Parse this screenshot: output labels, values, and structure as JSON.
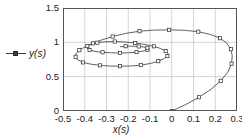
{
  "legend": {
    "marker": "filled-square-line-marker",
    "label": "y(s)"
  },
  "axes": {
    "xlabel": "x(s)",
    "ylabel": "",
    "xticks": [
      "-0.5",
      "-0.4",
      "-0.3",
      "-0.2",
      "-0.1",
      "0",
      "0.1",
      "0.2",
      "0.3"
    ],
    "yticks": [
      "0",
      "0.5",
      "1",
      "1.5"
    ]
  },
  "colors": {
    "line": "#3a3a3a",
    "marker_face": "#ffffff",
    "marker_edge": "#2a2a2a",
    "grid": "#b9b9b9",
    "frame": "#555555",
    "text": "#1a1a1a"
  },
  "chart_data": {
    "type": "line",
    "title": "",
    "xlabel": "x(s)",
    "ylabel": "y(s)",
    "xlim": [
      -0.5,
      0.3
    ],
    "ylim": [
      0,
      1.5
    ],
    "grid": true,
    "legend_position": "left-outside",
    "series": [
      {
        "name": "y(s)",
        "marker": "square",
        "points": [
          [
            0.0,
            0.0
          ],
          [
            0.065,
            0.095
          ],
          [
            0.125,
            0.2
          ],
          [
            0.18,
            0.315
          ],
          [
            0.225,
            0.44
          ],
          [
            0.258,
            0.565
          ],
          [
            0.275,
            0.69
          ],
          [
            0.278,
            0.8
          ],
          [
            0.272,
            0.9
          ],
          [
            0.252,
            0.99
          ],
          [
            0.222,
            1.06
          ],
          [
            0.178,
            1.115
          ],
          [
            0.122,
            1.155
          ],
          [
            0.058,
            1.175
          ],
          [
            -0.012,
            1.182
          ],
          [
            -0.082,
            1.178
          ],
          [
            -0.148,
            1.162
          ],
          [
            -0.212,
            1.13
          ],
          [
            -0.272,
            1.085
          ],
          [
            -0.322,
            1.035
          ],
          [
            -0.362,
            0.985
          ],
          [
            -0.398,
            0.935
          ],
          [
            -0.425,
            0.885
          ],
          [
            -0.44,
            0.835
          ],
          [
            -0.442,
            0.79
          ],
          [
            -0.432,
            0.745
          ],
          [
            -0.408,
            0.708
          ],
          [
            -0.372,
            0.682
          ],
          [
            -0.33,
            0.665
          ],
          [
            -0.285,
            0.655
          ],
          [
            -0.238,
            0.652
          ],
          [
            -0.19,
            0.655
          ],
          [
            -0.142,
            0.668
          ],
          [
            -0.098,
            0.692
          ],
          [
            -0.062,
            0.725
          ],
          [
            -0.035,
            0.762
          ],
          [
            -0.02,
            0.8
          ],
          [
            -0.018,
            0.838
          ],
          [
            -0.028,
            0.872
          ],
          [
            -0.05,
            0.908
          ],
          [
            -0.082,
            0.942
          ],
          [
            -0.122,
            0.968
          ],
          [
            -0.168,
            0.99
          ],
          [
            -0.215,
            1.005
          ],
          [
            -0.262,
            1.012
          ],
          [
            -0.305,
            1.008
          ],
          [
            -0.342,
            0.995
          ],
          [
            -0.37,
            0.972
          ],
          [
            -0.388,
            0.945
          ],
          [
            -0.39,
            0.915
          ],
          [
            -0.378,
            0.888
          ],
          [
            -0.352,
            0.868
          ],
          [
            -0.318,
            0.855
          ],
          [
            -0.278,
            0.848
          ],
          [
            -0.238,
            0.845
          ],
          [
            -0.198,
            0.848
          ],
          [
            -0.162,
            0.858
          ],
          [
            -0.132,
            0.872
          ],
          [
            -0.112,
            0.888
          ],
          [
            -0.105,
            0.905
          ],
          [
            -0.112,
            0.92
          ],
          [
            -0.128,
            0.932
          ],
          [
            -0.152,
            0.94
          ],
          [
            -0.182,
            0.945
          ],
          [
            -0.212,
            0.943
          ],
          [
            -0.238,
            0.935
          ]
        ]
      }
    ]
  }
}
